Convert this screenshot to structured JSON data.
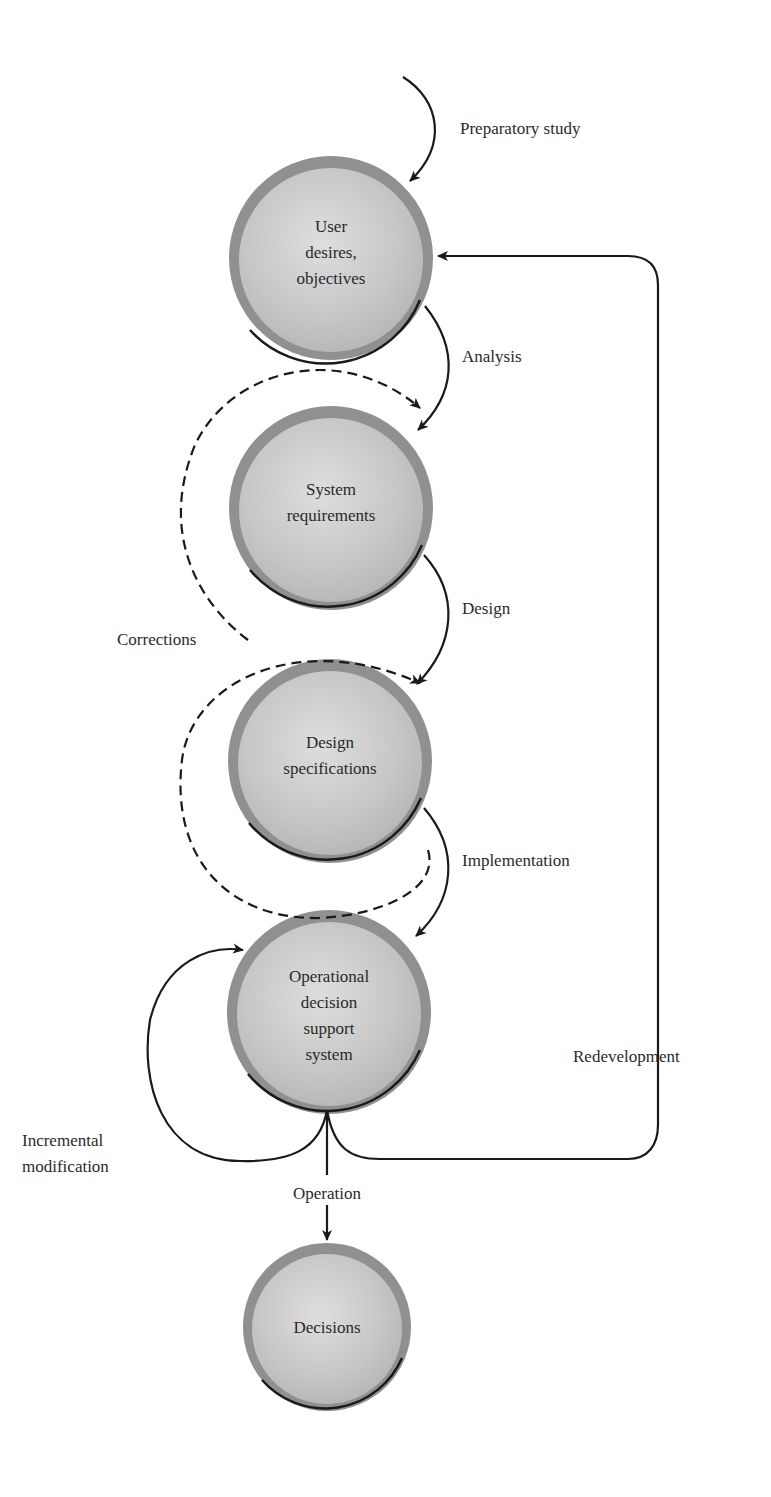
{
  "diagram": {
    "type": "process-flow",
    "nodes": [
      {
        "id": "user",
        "lines": [
          "User",
          "desires,",
          "objectives"
        ]
      },
      {
        "id": "sysreq",
        "lines": [
          "System",
          "requirements"
        ]
      },
      {
        "id": "designspec",
        "lines": [
          "Design",
          "specifications"
        ]
      },
      {
        "id": "odss",
        "lines": [
          "Operational",
          "decision",
          "support",
          "system"
        ]
      },
      {
        "id": "decisions",
        "lines": [
          "Decisions"
        ]
      }
    ],
    "edges": {
      "preparatory": "Preparatory study",
      "analysis": "Analysis",
      "design": "Design",
      "corrections": "Corrections",
      "implementation": "Implementation",
      "incremental_1": "Incremental",
      "incremental_2": "modification",
      "operation": "Operation",
      "redevelopment": "Redevelopment"
    },
    "colors": {
      "circle_fill": "#c9c9c9",
      "circle_ring": "#8f8f8f",
      "line": "#1a1a1a"
    }
  }
}
